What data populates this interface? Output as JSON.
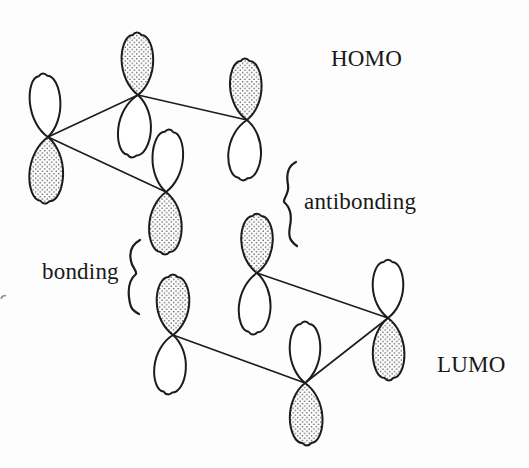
{
  "figure": {
    "background": "#fdfdfd",
    "ink": "#1c1c1c",
    "labels": {
      "homo": "HOMO",
      "lumo": "LUMO",
      "antibonding": "antibonding",
      "bonding": "bonding"
    },
    "diagram": {
      "canvas": [
        529,
        468
      ],
      "stipple_dot_color": "#3a3a3a",
      "lobe_fill_white": "#ffffff",
      "orbitals": [
        {
          "id": "homo-c1",
          "group": "HOMO",
          "node": [
            48,
            137
          ],
          "lobes": [
            {
              "tip": [
                43,
                76
              ],
              "shaded": false,
              "w": 30
            },
            {
              "tip": [
                45,
                201
              ],
              "shaded": true,
              "w": 33
            }
          ]
        },
        {
          "id": "homo-c2",
          "group": "HOMO",
          "node": [
            138,
            95
          ],
          "lobes": [
            {
              "tip": [
                137,
                35
              ],
              "shaded": true,
              "w": 31
            },
            {
              "tip": [
                132,
                155
              ],
              "shaded": false,
              "w": 32
            }
          ]
        },
        {
          "id": "homo-c3",
          "group": "HOMO",
          "node": [
            166,
            192
          ],
          "lobes": [
            {
              "tip": [
                169,
                132
              ],
              "shaded": false,
              "w": 30
            },
            {
              "tip": [
                165,
                252
              ],
              "shaded": true,
              "w": 32
            }
          ]
        },
        {
          "id": "homo-c4",
          "group": "HOMO",
          "node": [
            247,
            120
          ],
          "lobes": [
            {
              "tip": [
                245,
                61
              ],
              "shaded": true,
              "w": 31
            },
            {
              "tip": [
                243,
                178
              ],
              "shaded": false,
              "w": 32
            }
          ]
        },
        {
          "id": "lumo-c1",
          "group": "LUMO",
          "node": [
            257,
            273
          ],
          "lobes": [
            {
              "tip": [
                257,
                216
              ],
              "shaded": true,
              "w": 31
            },
            {
              "tip": [
                253,
                332
              ],
              "shaded": false,
              "w": 31
            }
          ]
        },
        {
          "id": "lumo-c2",
          "group": "LUMO",
          "node": [
            173,
            335
          ],
          "lobes": [
            {
              "tip": [
                173,
                277
              ],
              "shaded": true,
              "w": 32
            },
            {
              "tip": [
                168,
                392
              ],
              "shaded": false,
              "w": 31
            }
          ]
        },
        {
          "id": "lumo-c3",
          "group": "LUMO",
          "node": [
            305,
            383
          ],
          "lobes": [
            {
              "tip": [
                305,
                324
              ],
              "shaded": false,
              "w": 30
            },
            {
              "tip": [
                307,
                443
              ],
              "shaded": true,
              "w": 32
            }
          ]
        },
        {
          "id": "lumo-c4",
          "group": "LUMO",
          "node": [
            388,
            318
          ],
          "lobes": [
            {
              "tip": [
                388,
                262
              ],
              "shaded": false,
              "w": 30
            },
            {
              "tip": [
                389,
                378
              ],
              "shaded": true,
              "w": 31
            }
          ]
        }
      ],
      "bonds": [
        [
          0,
          1
        ],
        [
          1,
          3
        ],
        [
          0,
          2
        ],
        [
          4,
          7
        ],
        [
          7,
          6
        ],
        [
          6,
          5
        ]
      ],
      "braces": [
        {
          "id": "antibonding-brace",
          "d": "M 296 162 C 288 166 286 174 288 185 C 289.5 194 283 198 284 202 C 291 208 292 216 290 226 C 288 237 290 241 297 246"
        },
        {
          "id": "bonding-brace",
          "d": "M 140 240 C 131 245 129 252 131 261 C 132 268 137 270 136 274 C 130 279 128 288 129 297 C 130 306 131 310 139 314"
        }
      ],
      "stray_mark": {
        "d": "M 1 299 C 2 296 4 295 6 296"
      }
    }
  }
}
